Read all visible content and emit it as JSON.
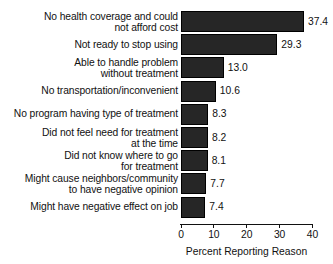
{
  "chart_data": {
    "type": "bar",
    "orientation": "horizontal",
    "title": "",
    "subtitle": "",
    "xlabel": "Percent Reporting Reason",
    "ylabel": "",
    "xlim": [
      0,
      40
    ],
    "xticks": [
      0,
      10,
      20,
      30,
      40
    ],
    "xtick_labels": [
      "0",
      "10",
      "20",
      "30",
      "40"
    ],
    "grid": false,
    "legend": null,
    "bar_color": "#262626",
    "categories": [
      "No health coverage and could\nnot afford cost",
      "Not ready to stop using",
      "Able to handle problem\nwithout treatment",
      "No transportation/inconvenient",
      "No program having type of treatment",
      "Did not feel need for treatment\nat the time",
      "Did not know where to go\nfor treatment",
      "Might cause neighbors/community\nto have negative opinion",
      "Might have negative effect on job"
    ],
    "values": [
      37.4,
      29.3,
      13.0,
      10.6,
      8.3,
      8.2,
      8.1,
      7.7,
      7.4
    ],
    "value_labels": [
      "37.4",
      "29.3",
      "13.0",
      "10.6",
      "8.3",
      "8.2",
      "8.1",
      "7.7",
      "7.4"
    ],
    "category_lines": [
      2,
      1,
      2,
      1,
      1,
      2,
      2,
      2,
      1
    ]
  }
}
